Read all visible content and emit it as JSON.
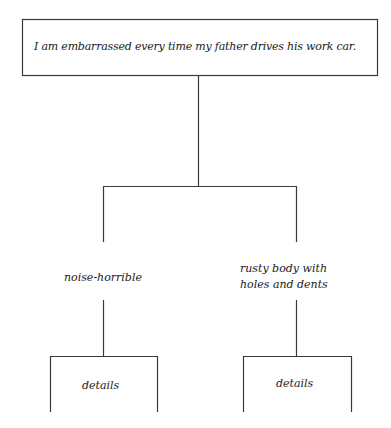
{
  "diagram": {
    "type": "tree",
    "root": {
      "text": "I am embarrassed every time my father drives his work car."
    },
    "branches": [
      {
        "label": "noise-horrible",
        "child": {
          "text": "details"
        }
      },
      {
        "label_line1": "rusty body with",
        "label_line2": "holes and dents",
        "child": {
          "text": "details"
        }
      }
    ],
    "colors": {
      "line": "#3a3a3a",
      "text": "#1a1a1a",
      "background": "#ffffff"
    }
  }
}
